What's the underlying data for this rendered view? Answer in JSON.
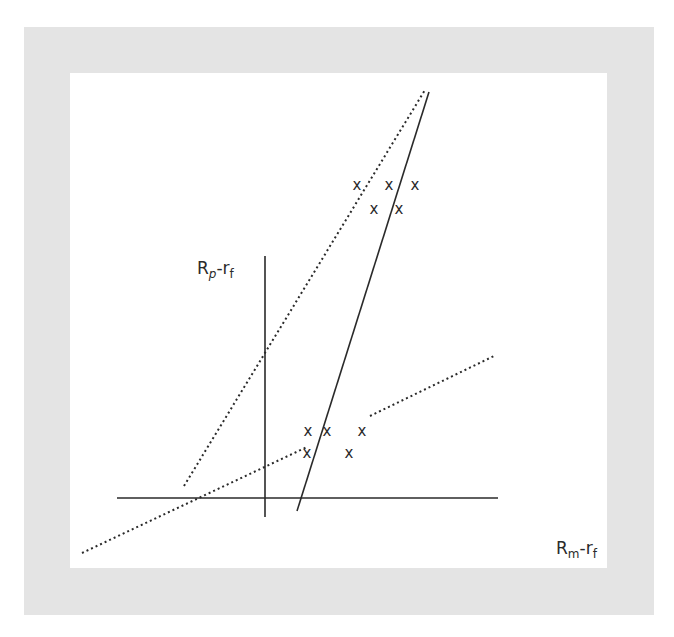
{
  "diagram": {
    "y_axis_label": {
      "main": "R",
      "sub1": "p",
      "dash": "-r",
      "sub2": "f"
    },
    "x_axis_label": {
      "main": "R",
      "sub1": "m",
      "dash": "-r",
      "sub2": "f"
    },
    "marker_glyph": "x",
    "upper_cluster_count": 5,
    "lower_cluster_count": 5,
    "colors": {
      "frame": "#e4e4e4",
      "ink": "#2a2a2a",
      "panel": "#ffffff"
    }
  }
}
